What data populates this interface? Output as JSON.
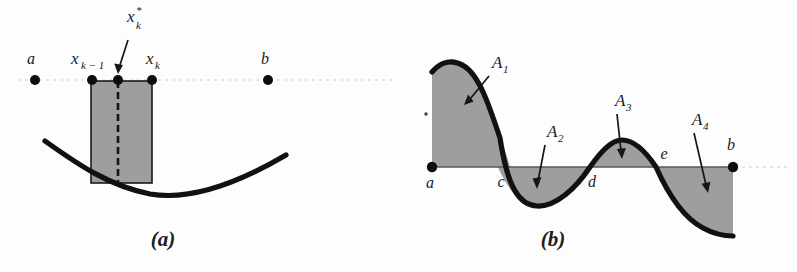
{
  "figure": {
    "background_color": "#fdfdfd",
    "ink_color": "#111111",
    "shade_color": "#8d8d8d"
  },
  "panels": [
    {
      "id": "a",
      "caption": "(a)",
      "description": "Partition points on an axis with one shaded approximating rectangle over a concave-up curve",
      "axis_points": [
        {
          "name": "a",
          "label": "a",
          "label_sub": "",
          "label_sup": "",
          "x": 35,
          "y": 80
        },
        {
          "name": "x-k-1",
          "label": "x",
          "label_sub": "k − 1",
          "label_sup": "",
          "x": 92,
          "y": 80
        },
        {
          "name": "x-k-star",
          "label": "x",
          "label_sub": "k",
          "label_sup": "*",
          "x": 118,
          "y": 80
        },
        {
          "name": "x-k",
          "label": "x",
          "label_sub": "k",
          "label_sup": "",
          "x": 152,
          "y": 80
        },
        {
          "name": "b",
          "label": "b",
          "label_sub": "",
          "label_sup": "",
          "x": 268,
          "y": 80
        }
      ],
      "rectangle": {
        "left": 91,
        "right": 152,
        "top": 81,
        "bottom": 183
      },
      "sample_dash_x": 118,
      "curve_endpoints": {
        "left_x": 45,
        "left_y": 141,
        "right_x": 286,
        "right_y": 155
      },
      "curve_min": {
        "x": 168,
        "y": 196
      }
    },
    {
      "id": "b",
      "caption": "(b)",
      "description": "Oscillating curve with four signed regions A1 to A4 between curve and x-axis",
      "baseline_y": 167,
      "axis_points": [
        {
          "name": "a",
          "label": "a",
          "x": 432,
          "y": 167,
          "dot": true
        },
        {
          "name": "c",
          "label": "c",
          "x": 500,
          "y": 167,
          "dot": false
        },
        {
          "name": "d",
          "label": "d",
          "x": 590,
          "y": 167,
          "dot": false
        },
        {
          "name": "e",
          "label": "e",
          "x": 656,
          "y": 167,
          "dot": false
        },
        {
          "name": "b",
          "label": "b",
          "x": 733,
          "y": 167,
          "dot": true
        }
      ],
      "regions": [
        {
          "name": "A1",
          "label": "A",
          "subscript": "1",
          "sign": "positive",
          "label_x": 497,
          "label_y": 64,
          "arrow_to_x": 466,
          "arrow_to_y": 104
        },
        {
          "name": "A2",
          "label": "A",
          "subscript": "2",
          "sign": "negative",
          "label_x": 552,
          "label_y": 133,
          "arrow_to_x": 537,
          "arrow_to_y": 188
        },
        {
          "name": "A3",
          "label": "A",
          "subscript": "3",
          "sign": "positive",
          "label_x": 621,
          "label_y": 102,
          "arrow_to_x": 622,
          "arrow_to_y": 158
        },
        {
          "name": "A4",
          "label": "A",
          "subscript": "4",
          "sign": "negative",
          "label_x": 699,
          "label_y": 121,
          "arrow_to_x": 708,
          "arrow_to_y": 192
        }
      ]
    }
  ]
}
